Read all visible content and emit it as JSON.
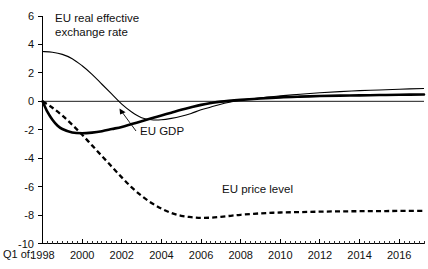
{
  "chart_data": {
    "type": "line",
    "title": "",
    "subtitle": "",
    "xlabel": "",
    "ylabel": "",
    "xlim": [
      1998,
      2017.25
    ],
    "ylim": [
      -10,
      6
    ],
    "grid": false,
    "legend_position": "inline-annotations",
    "y_ticks": [
      6,
      4,
      2,
      0,
      -2,
      -4,
      -6,
      -8,
      -10
    ],
    "y_tick_labels": [
      "6",
      "4",
      "2",
      "0",
      "-2",
      "-4",
      "-6",
      "-8",
      "-10"
    ],
    "x_ticks": [
      1998,
      2000,
      2002,
      2004,
      2006,
      2008,
      2010,
      2012,
      2014,
      2016
    ],
    "x_tick_labels": [
      "1998",
      "2000",
      "2002",
      "2004",
      "2006",
      "2008",
      "2010",
      "2012",
      "2014",
      "2016"
    ],
    "x_axis_prefix": "Q1 of:",
    "x_minor_tick_step": 0.25,
    "zero_line": 0,
    "series": [
      {
        "name": "EU real effective exchange rate",
        "style": "thin-solid",
        "color": "#000000",
        "x": [
          1998,
          1998.5,
          1999,
          1999.5,
          2000,
          2000.5,
          2001,
          2001.5,
          2002,
          2002.5,
          2003,
          2003.5,
          2004,
          2004.5,
          2005,
          2005.5,
          2006,
          2006.5,
          2007,
          2007.5,
          2008,
          2009,
          2010,
          2011,
          2012,
          2013,
          2014,
          2015,
          2016,
          2017.25
        ],
        "values": [
          3.5,
          3.45,
          3.3,
          3.0,
          2.5,
          1.9,
          1.2,
          0.5,
          -0.2,
          -0.75,
          -1.15,
          -1.3,
          -1.3,
          -1.2,
          -1.05,
          -0.85,
          -0.6,
          -0.4,
          -0.2,
          -0.05,
          0.08,
          0.25,
          0.38,
          0.5,
          0.6,
          0.68,
          0.75,
          0.8,
          0.85,
          0.9
        ]
      },
      {
        "name": "EU GDP",
        "style": "thick-solid",
        "color": "#000000",
        "x": [
          1998,
          1998.25,
          1998.5,
          1998.75,
          1999,
          1999.5,
          2000,
          2000.5,
          2001,
          2001.5,
          2002,
          2002.5,
          2003,
          2003.5,
          2004,
          2004.5,
          2005,
          2005.5,
          2006,
          2006.5,
          2007,
          2008,
          2009,
          2010,
          2011,
          2012,
          2013,
          2014,
          2015,
          2016,
          2017.25
        ],
        "values": [
          0.0,
          -0.75,
          -1.3,
          -1.7,
          -1.95,
          -2.2,
          -2.25,
          -2.2,
          -2.1,
          -1.95,
          -1.8,
          -1.6,
          -1.4,
          -1.2,
          -1.0,
          -0.8,
          -0.6,
          -0.42,
          -0.25,
          -0.12,
          -0.02,
          0.1,
          0.2,
          0.28,
          0.33,
          0.37,
          0.4,
          0.42,
          0.44,
          0.46,
          0.48
        ]
      },
      {
        "name": "EU price level",
        "style": "thick-dashed",
        "color": "#000000",
        "x": [
          1998,
          1998.5,
          1999,
          1999.5,
          2000,
          2000.5,
          2001,
          2001.5,
          2002,
          2002.5,
          2003,
          2003.5,
          2004,
          2004.5,
          2005,
          2005.5,
          2006,
          2006.5,
          2007,
          2007.5,
          2008,
          2009,
          2010,
          2011,
          2012,
          2013,
          2014,
          2015,
          2016,
          2017.25
        ],
        "values": [
          0.0,
          -0.45,
          -1.0,
          -1.65,
          -2.35,
          -3.1,
          -3.85,
          -4.6,
          -5.35,
          -6.05,
          -6.65,
          -7.15,
          -7.55,
          -7.85,
          -8.05,
          -8.15,
          -8.2,
          -8.18,
          -8.12,
          -8.05,
          -7.98,
          -7.88,
          -7.82,
          -7.79,
          -7.76,
          -7.74,
          -7.73,
          -7.72,
          -7.71,
          -7.7
        ]
      }
    ],
    "annotations": [
      {
        "name": "exchange-rate-label",
        "lines": [
          "EU real effective",
          "exchange rate"
        ],
        "x_px": 55,
        "y_px": 22
      },
      {
        "name": "gdp-label",
        "lines": [
          "EU GDP"
        ],
        "x_px": 140,
        "y_px": 135
      },
      {
        "name": "price-level-label",
        "lines": [
          "EU price level"
        ],
        "x_px": 222,
        "y_px": 193
      }
    ]
  }
}
